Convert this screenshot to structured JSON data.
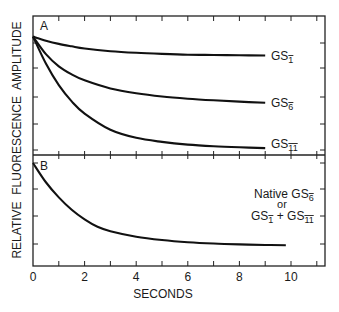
{
  "chart_data": [
    {
      "panel": "A",
      "type": "line",
      "title": "",
      "xlabel": "SECONDS",
      "ylabel": "RELATIVE FLUORESCENCE AMPLITUDE",
      "xlim": [
        0,
        11.3
      ],
      "ylim_relative": [
        0,
        5.1
      ],
      "grid": false,
      "x": [
        0,
        0.5,
        1,
        1.5,
        2,
        3,
        4,
        5,
        6,
        7,
        8,
        9
      ],
      "series": [
        {
          "name": "GS1-",
          "label": "GS",
          "sub": "1",
          "values": [
            4.2,
            4.05,
            3.93,
            3.84,
            3.76,
            3.66,
            3.6,
            3.56,
            3.53,
            3.52,
            3.51,
            3.5
          ]
        },
        {
          "name": "GS6-",
          "label": "GS",
          "sub": "6",
          "values": [
            4.2,
            3.55,
            3.1,
            2.8,
            2.58,
            2.28,
            2.1,
            1.98,
            1.9,
            1.84,
            1.79,
            1.75
          ]
        },
        {
          "name": "GS11-",
          "label": "GS",
          "sub": "11",
          "values": [
            4.2,
            3.2,
            2.4,
            1.8,
            1.35,
            0.75,
            0.45,
            0.3,
            0.2,
            0.14,
            0.1,
            0.07
          ]
        }
      ]
    },
    {
      "panel": "B",
      "type": "line",
      "xlabel": "SECONDS",
      "xlim": [
        0,
        11.3
      ],
      "ylim_relative": [
        0,
        4.1
      ],
      "x": [
        0,
        0.5,
        1,
        1.5,
        2,
        2.5,
        3,
        4,
        5,
        6,
        7,
        8,
        9,
        9.8
      ],
      "series": [
        {
          "name": "Native GS6- or GS1- + GS11-",
          "values": [
            3.6,
            2.9,
            2.35,
            1.9,
            1.55,
            1.28,
            1.12,
            0.92,
            0.8,
            0.72,
            0.67,
            0.64,
            0.62,
            0.61
          ]
        }
      ],
      "annotation": [
        "Native GS6-",
        "or",
        "GS1- + GS11-"
      ]
    }
  ],
  "labels": {
    "panel_a": "A",
    "panel_b": "B",
    "ylabel": "RELATIVE  FLUORESCENCE  AMPLITUDE",
    "xlabel": "SECONDS",
    "xticks": [
      "0",
      "2",
      "4",
      "6",
      "8",
      "10"
    ],
    "gs": "GS",
    "sub1": "1",
    "sub6": "6",
    "sub11": "11",
    "native": "Native GS",
    "or": "or",
    "plus": " + "
  }
}
